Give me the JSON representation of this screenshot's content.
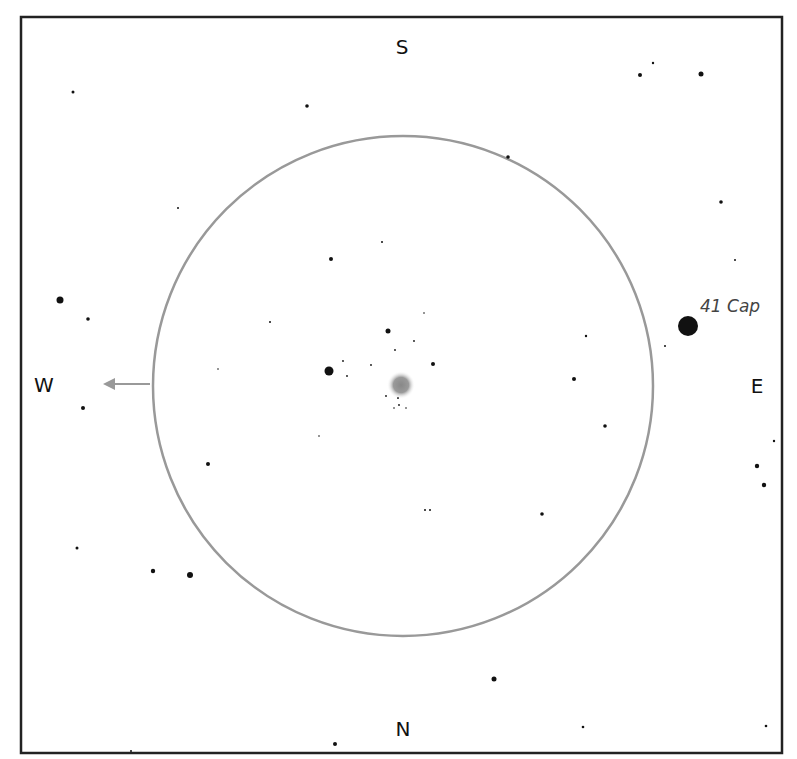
{
  "header": {
    "title_partial": ""
  },
  "chart": {
    "frame": {
      "x": 21,
      "y": 17,
      "width": 761,
      "height": 736,
      "stroke": "#222222"
    },
    "field_circle": {
      "cx": 403,
      "cy": 386,
      "r": 250,
      "stroke": "#999999"
    },
    "directions": {
      "top": "S",
      "bottom": "N",
      "left": "W",
      "right": "E"
    },
    "direction_arrow": {
      "from": [
        150,
        384
      ],
      "to": [
        103,
        384
      ],
      "color": "#999999"
    },
    "target_object": {
      "type": "nebula",
      "cx": 401,
      "cy": 385,
      "r": 14
    },
    "labeled_star": {
      "name": "41 Cap",
      "cx": 688,
      "cy": 326,
      "r": 10
    },
    "stars": [
      {
        "x": 73,
        "y": 92,
        "r": 1.5
      },
      {
        "x": 307,
        "y": 106,
        "r": 1.8
      },
      {
        "x": 178,
        "y": 208,
        "r": 1
      },
      {
        "x": 331,
        "y": 259,
        "r": 2
      },
      {
        "x": 60,
        "y": 300,
        "r": 3.5
      },
      {
        "x": 88,
        "y": 319,
        "r": 1.8
      },
      {
        "x": 270,
        "y": 322,
        "r": 1
      },
      {
        "x": 640,
        "y": 75,
        "r": 2
      },
      {
        "x": 653,
        "y": 63,
        "r": 1.2
      },
      {
        "x": 701,
        "y": 74,
        "r": 2.5
      },
      {
        "x": 508,
        "y": 157,
        "r": 1.8
      },
      {
        "x": 721,
        "y": 202,
        "r": 1.8
      },
      {
        "x": 735,
        "y": 260,
        "r": 1
      },
      {
        "x": 382,
        "y": 242,
        "r": 1
      },
      {
        "x": 329,
        "y": 371,
        "r": 4.5
      },
      {
        "x": 388,
        "y": 331,
        "r": 2.5
      },
      {
        "x": 433,
        "y": 364,
        "r": 2
      },
      {
        "x": 343,
        "y": 361,
        "r": 0.9
      },
      {
        "x": 347,
        "y": 376,
        "r": 0.9
      },
      {
        "x": 371,
        "y": 365,
        "r": 0.9
      },
      {
        "x": 395,
        "y": 350,
        "r": 0.9
      },
      {
        "x": 414,
        "y": 341,
        "r": 0.9
      },
      {
        "x": 424,
        "y": 313,
        "r": 0.8
      },
      {
        "x": 386,
        "y": 396,
        "r": 0.9
      },
      {
        "x": 398,
        "y": 398,
        "r": 1
      },
      {
        "x": 399,
        "y": 405,
        "r": 0.9
      },
      {
        "x": 394,
        "y": 408,
        "r": 0.8
      },
      {
        "x": 406,
        "y": 408,
        "r": 0.8
      },
      {
        "x": 319,
        "y": 436,
        "r": 0.8
      },
      {
        "x": 218,
        "y": 369,
        "r": 0.8
      },
      {
        "x": 586,
        "y": 336,
        "r": 1.2
      },
      {
        "x": 574,
        "y": 379,
        "r": 2
      },
      {
        "x": 605,
        "y": 426,
        "r": 1.8
      },
      {
        "x": 665,
        "y": 346,
        "r": 1
      },
      {
        "x": 774,
        "y": 441,
        "r": 1.2
      },
      {
        "x": 757,
        "y": 466,
        "r": 2.2
      },
      {
        "x": 764,
        "y": 485,
        "r": 2.2
      },
      {
        "x": 425,
        "y": 510,
        "r": 1
      },
      {
        "x": 430,
        "y": 510,
        "r": 1
      },
      {
        "x": 542,
        "y": 514,
        "r": 1.8
      },
      {
        "x": 83,
        "y": 408,
        "r": 2
      },
      {
        "x": 208,
        "y": 464,
        "r": 2
      },
      {
        "x": 77,
        "y": 548,
        "r": 1.5
      },
      {
        "x": 153,
        "y": 571,
        "r": 2.2
      },
      {
        "x": 190,
        "y": 575,
        "r": 3
      },
      {
        "x": 494,
        "y": 679,
        "r": 2.5
      },
      {
        "x": 583,
        "y": 727,
        "r": 1.3
      },
      {
        "x": 766,
        "y": 726,
        "r": 1.3
      },
      {
        "x": 335,
        "y": 744,
        "r": 2
      },
      {
        "x": 131,
        "y": 751,
        "r": 1
      }
    ]
  }
}
